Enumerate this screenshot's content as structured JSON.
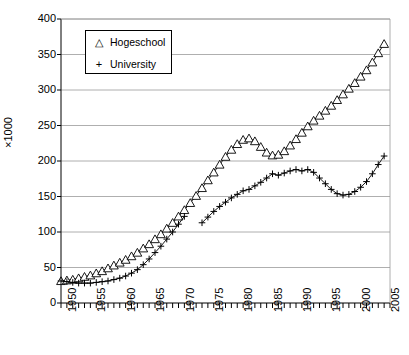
{
  "chart_data": {
    "type": "line",
    "title": "",
    "subtitle": "",
    "xlabel": "",
    "ylabel": "×1000",
    "xlim": [
      1950,
      2006
    ],
    "ylim": [
      0,
      400
    ],
    "ytick_step": 50,
    "yticks": [
      0,
      50,
      100,
      150,
      200,
      250,
      300,
      350,
      400
    ],
    "xticks_labeled": [
      1950,
      1955,
      1960,
      1965,
      1970,
      1975,
      1980,
      1985,
      1990,
      1995,
      2000,
      2005
    ],
    "xtick_interval_minor": 1,
    "grid": "horizontal",
    "legend_position": "top-left-inside",
    "legend": [
      {
        "label": "Hogeschool",
        "marker": "triangle-up"
      },
      {
        "label": "University",
        "marker": "plus"
      }
    ],
    "series": [
      {
        "name": "Hogeschool",
        "marker": "triangle-up",
        "color": "#000000",
        "x": [
          1950,
          1951,
          1952,
          1953,
          1954,
          1955,
          1956,
          1957,
          1958,
          1959,
          1960,
          1961,
          1962,
          1963,
          1964,
          1965,
          1966,
          1967,
          1968,
          1969,
          1970,
          1971,
          1972,
          1973,
          1974,
          1975,
          1976,
          1977,
          1978,
          1979,
          1980,
          1981,
          1982,
          1983,
          1984,
          1985,
          1986,
          1987,
          1988,
          1989,
          1990,
          1991,
          1992,
          1993,
          1994,
          1995,
          1996,
          1997,
          1998,
          1999,
          2000,
          2001,
          2002,
          2003,
          2004,
          2005
        ],
        "y": [
          31,
          32,
          33,
          35,
          37,
          39,
          42,
          45,
          49,
          53,
          57,
          61,
          66,
          71,
          77,
          83,
          90,
          97,
          105,
          113,
          122,
          131,
          141,
          151,
          162,
          173,
          184,
          195,
          206,
          216,
          224,
          230,
          232,
          228,
          220,
          212,
          208,
          209,
          214,
          222,
          231,
          240,
          249,
          257,
          264,
          271,
          278,
          286,
          294,
          302,
          310,
          319,
          328,
          339,
          352,
          365
        ]
      },
      {
        "name": "University",
        "marker": "plus",
        "color": "#000000",
        "segments": [
          {
            "x": [
              1950,
              1951,
              1952,
              1953,
              1954,
              1955,
              1956,
              1957,
              1958,
              1959,
              1960,
              1961,
              1962,
              1963,
              1964,
              1965,
              1966,
              1967,
              1968,
              1969,
              1970,
              1971
            ],
            "y": [
              31,
              30,
              29,
              28,
              28,
              28,
              29,
              30,
              31,
              33,
              35,
              38,
              42,
              47,
              54,
              62,
              71,
              80,
              90,
              100,
              111,
              122
            ]
          },
          {
            "x": [
              1974,
              1975,
              1976,
              1977,
              1978,
              1979,
              1980,
              1981,
              1982,
              1983,
              1984,
              1985,
              1986,
              1987,
              1988,
              1989,
              1990,
              1991,
              1992,
              1993,
              1994,
              1995,
              1996,
              1997,
              1998,
              1999,
              2000,
              2001,
              2002,
              2003,
              2004,
              2005
            ],
            "y": [
              113,
              121,
              129,
              136,
              142,
              148,
              153,
              158,
              160,
              165,
              170,
              176,
              182,
              180,
              183,
              186,
              188,
              186,
              188,
              184,
              176,
              168,
              160,
              154,
              152,
              153,
              157,
              163,
              171,
              182,
              195,
              207
            ]
          }
        ]
      }
    ]
  }
}
